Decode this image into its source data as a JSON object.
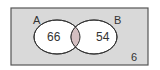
{
  "diagram": {
    "type": "venn",
    "sets": [
      {
        "label": "A",
        "only_value": "66"
      },
      {
        "label": "B",
        "only_value": "54"
      }
    ],
    "intersection_value": "",
    "outside_value": "6",
    "colors": {
      "universe_fill": "#d9d9d9",
      "universe_border": "#555555",
      "circle_fill": "#ffffff",
      "intersection_fill": "#d4bfc1",
      "stroke": "#333333"
    }
  }
}
